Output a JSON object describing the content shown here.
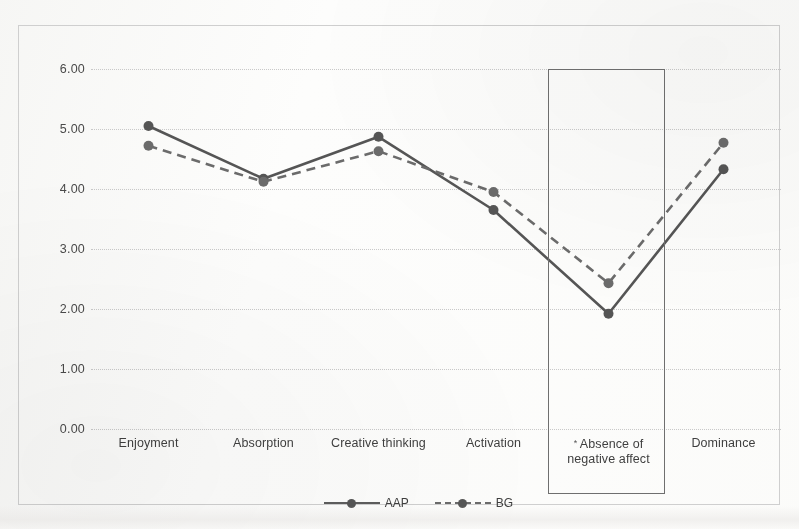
{
  "chart_data": {
    "type": "line",
    "title": "",
    "xlabel": "",
    "ylabel": "",
    "ylim": [
      0,
      6
    ],
    "ytick_step": 1,
    "grid": true,
    "legend_position": "bottom",
    "categories": [
      "Enjoyment",
      "Absorption",
      "Creative thinking",
      "Activation",
      "Absence of negative affect",
      "Dominance"
    ],
    "category_labels_display": [
      "Enjoyment",
      "Absorption",
      "Creative thinking",
      "Activation",
      "Absence of\nnegative affect",
      "Dominance"
    ],
    "ytick_labels": [
      "0.00",
      "1.00",
      "2.00",
      "3.00",
      "4.00",
      "5.00",
      "6.00"
    ],
    "ytick_values": [
      0,
      1,
      2,
      3,
      4,
      5,
      6
    ],
    "series": [
      {
        "name": "AAP",
        "style": "solid",
        "marker": "circle",
        "color": "#555555",
        "values": [
          5.05,
          4.17,
          4.87,
          3.65,
          1.92,
          4.33
        ]
      },
      {
        "name": "BG",
        "style": "dashed",
        "marker": "circle",
        "color": "#6b6b6b",
        "values": [
          4.72,
          4.12,
          4.63,
          3.95,
          2.43,
          4.77
        ]
      }
    ],
    "annotations": [
      {
        "name": "highlight-box",
        "type": "rectangle",
        "category": "Absence of negative affect",
        "note": "significance marker asterisk on category label"
      }
    ],
    "significance_marker": "*"
  },
  "legend": {
    "entries": [
      {
        "label": "AAP",
        "style": "solid"
      },
      {
        "label": "BG",
        "style": "dashed"
      }
    ]
  },
  "scan_artifact_text": ""
}
